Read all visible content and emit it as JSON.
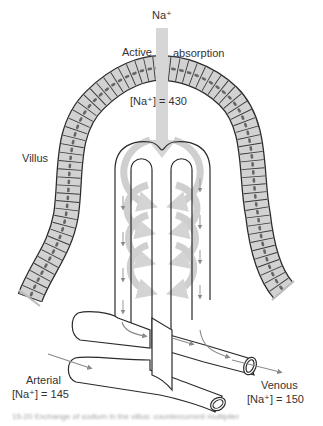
{
  "figure": {
    "type": "diagram",
    "labels": {
      "ion": "Na⁺",
      "active": "Active",
      "absorption": "absorption",
      "villus": "Villus",
      "tip_concentration": "[Na⁺] = 430",
      "arterial": "Arterial",
      "arterial_concentration": "[Na⁺] = 145",
      "venous": "Venous",
      "venous_concentration": "[Na⁺] = 150"
    },
    "caption": "15-20  Exchange of sodium in the villus: countercurrent multiplier",
    "colors": {
      "epithelium_fill": "#d2d2d2",
      "outline": "#2b2b2b",
      "flow_arrows": "#c8c8c8",
      "blood_arrows": "#8a8a8a",
      "background": "#ffffff"
    }
  }
}
